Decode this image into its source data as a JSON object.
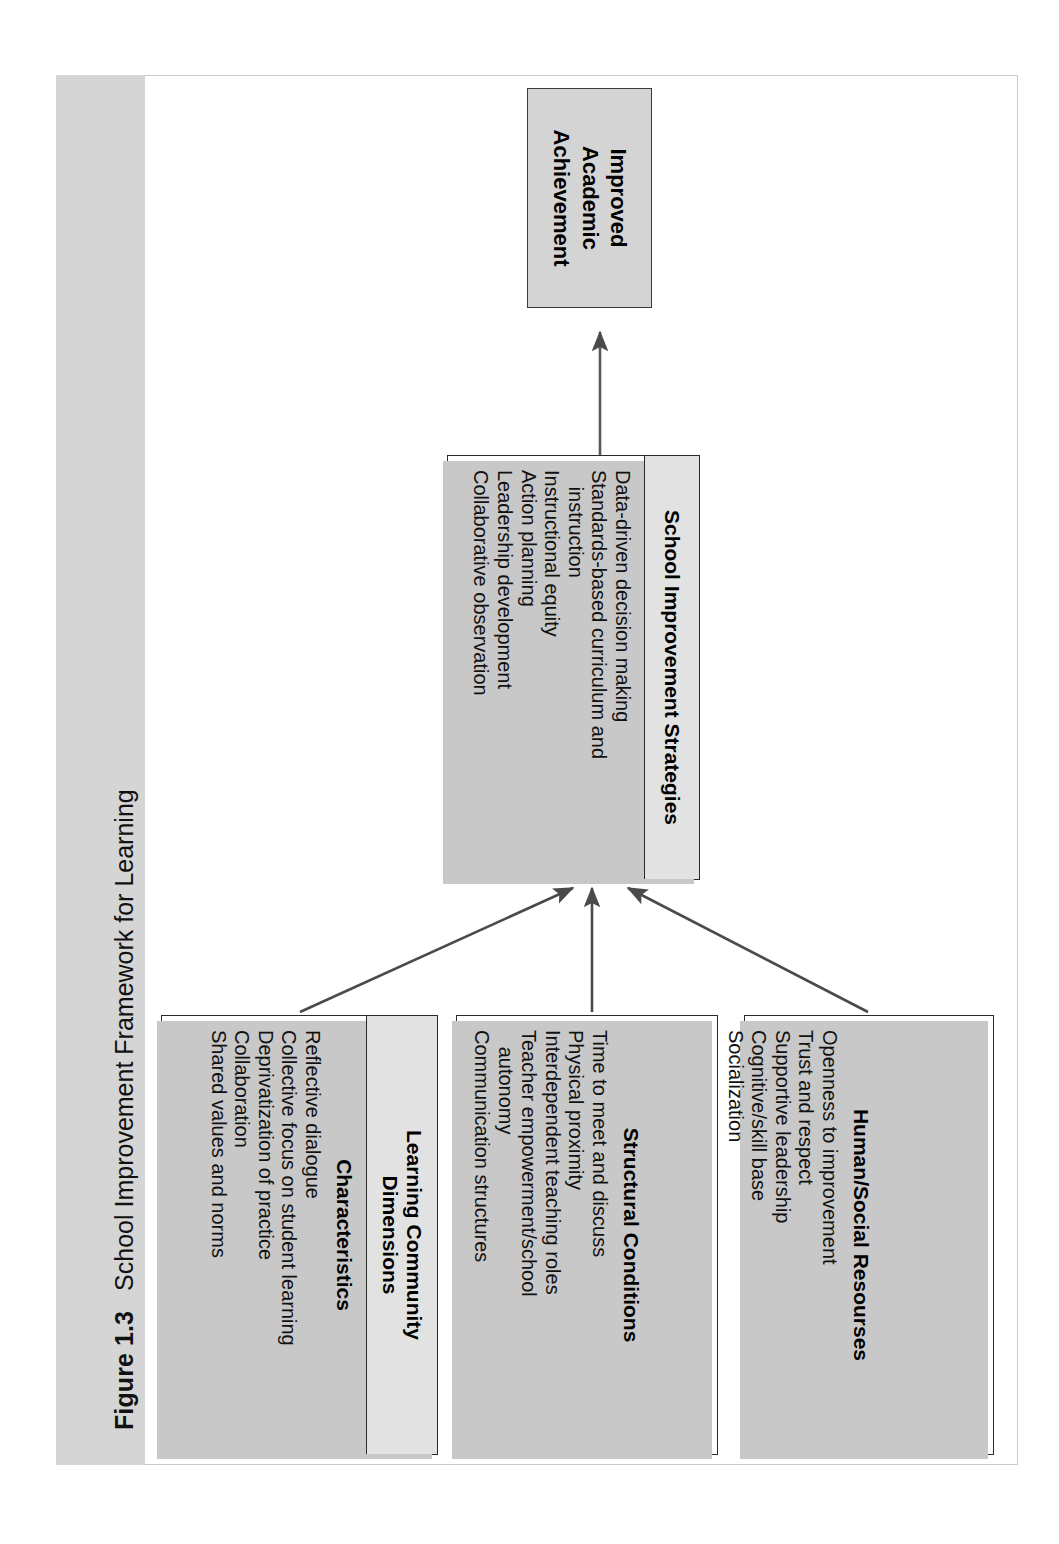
{
  "figure": {
    "number": "Figure 1.3",
    "title": "School Improvement Framework for Learning"
  },
  "diagram": {
    "type": "flowchart",
    "orientation": "rotated-90-counterclockwise",
    "goal": {
      "label_line1": "Improved",
      "label_line2": "Academic",
      "label_line3": "Achievement",
      "fill": "#d4d4d4"
    },
    "strategies": {
      "header": "School Improvement Strategies",
      "items": [
        "Data-driven decision making",
        "Standards-based curriculum and",
        "   instruction",
        "Instructional equity",
        "Action planning",
        "Leadership development",
        "Collaborative observation"
      ]
    },
    "dimensions": [
      {
        "header": "Learning Community",
        "header_line2": "Dimensions",
        "subhead": "Characteristics",
        "items": [
          "Reflective dialogue",
          "Collective focus on student learning",
          "Deprivatization of practice",
          "Collaboration",
          "Shared values and norms"
        ]
      },
      {
        "header": "",
        "header_line2": "",
        "subhead": "Structural Conditions",
        "items": [
          "Time to meet and discuss",
          "Physical proximity",
          "Interdependent teaching roles",
          "Teacher empowerment/school",
          "   autonomy",
          "Communication structures"
        ]
      },
      {
        "header": "",
        "header_line2": "",
        "subhead": "Human/Social Resourses",
        "items": [
          "Openness to improvement",
          "Trust and respect",
          "Supportive leadership",
          "Cognitive/skill base",
          "Socialization"
        ]
      }
    ],
    "connectors": [
      {
        "from": "learning-community-dimensions",
        "to": "school-improvement-strategies",
        "style": "arrow"
      },
      {
        "from": "structural-conditions",
        "to": "school-improvement-strategies",
        "style": "arrow"
      },
      {
        "from": "human-social-resourses",
        "to": "school-improvement-strategies",
        "style": "arrow"
      },
      {
        "from": "school-improvement-strategies",
        "to": "improved-academic-achievement",
        "style": "arrow"
      }
    ]
  }
}
